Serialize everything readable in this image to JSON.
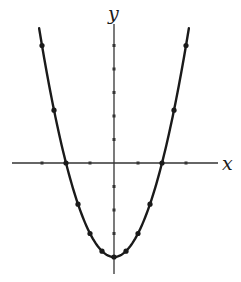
{
  "chart_data": {
    "type": "line",
    "title": "",
    "xlabel": "x",
    "ylabel": "y",
    "function": "y = x^2 - 4",
    "xlim": [
      -4.3,
      4.3
    ],
    "ylim": [
      -4.6,
      5.9
    ],
    "grid": false,
    "legend": null,
    "x_ticks": [
      -3,
      -2,
      -1,
      1,
      2,
      3
    ],
    "y_ticks": [
      -3,
      -2,
      -1,
      1,
      2,
      3,
      4,
      5
    ],
    "tick_labels_shown": false,
    "curve_x_range": [
      -3.12,
      3.12
    ],
    "series": [
      {
        "name": "parabola",
        "points": [
          {
            "x": -3,
            "y": 5
          },
          {
            "x": -2.5,
            "y": 2.25
          },
          {
            "x": -2,
            "y": 0
          },
          {
            "x": -1.5,
            "y": -1.75
          },
          {
            "x": -1,
            "y": -3
          },
          {
            "x": -0.5,
            "y": -3.75
          },
          {
            "x": 0,
            "y": -4
          },
          {
            "x": 0.5,
            "y": -3.75
          },
          {
            "x": 1,
            "y": -3
          },
          {
            "x": 1.5,
            "y": -1.75
          },
          {
            "x": 2,
            "y": 0
          },
          {
            "x": 2.5,
            "y": 2.25
          },
          {
            "x": 3,
            "y": 5
          }
        ]
      }
    ],
    "colors": {
      "curve": "#1a1a1a",
      "axes": "#333333",
      "background": "#ffffff"
    }
  }
}
